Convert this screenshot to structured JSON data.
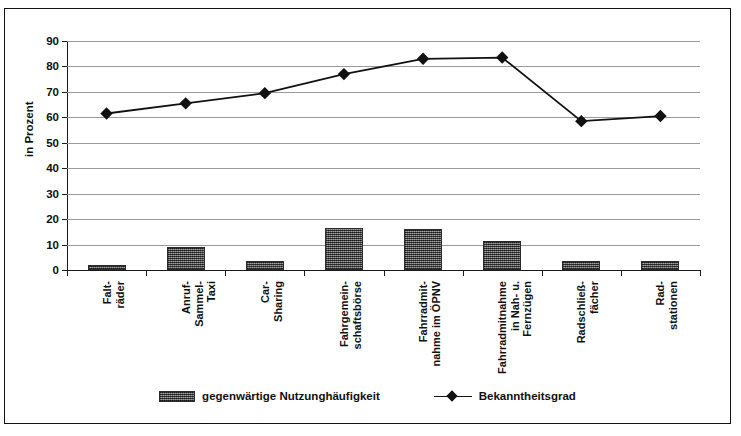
{
  "chart_data": {
    "type": "bar",
    "title": "",
    "xlabel": "",
    "ylabel": "in Prozent",
    "ylim": [
      0,
      90
    ],
    "yticks": [
      0,
      10,
      20,
      30,
      40,
      50,
      60,
      70,
      80,
      90
    ],
    "grid": true,
    "legend_position": "bottom",
    "categories": [
      "Falt-\nräder",
      "Anruf-\nSammel-\nTaxi",
      "Car-\nSharing",
      "Fahrgemein-\nschaftsbörse",
      "Fahrradmit-\nnahme im ÖPNV",
      "Fahrradmitnahme\nin Nah- u.\nFernzügen",
      "Radschließ-\nfächer",
      "Rad-\nstationen"
    ],
    "category_lines": [
      [
        "Falt-",
        "räder"
      ],
      [
        "Anruf-",
        "Sammel-",
        "Taxi"
      ],
      [
        "Car-",
        "Sharing"
      ],
      [
        "Fahrgemein-",
        "schaftsbörse"
      ],
      [
        "Fahrradmit-",
        "nahme im ÖPNV"
      ],
      [
        "Fahrradmitnahme",
        "in Nah- u.",
        "Fernzügen"
      ],
      [
        "Radschließ-",
        "fächer"
      ],
      [
        "Rad-",
        "stationen"
      ]
    ],
    "series": [
      {
        "name": "gegenwärtige Nutzunghäufigkeit",
        "type": "bar",
        "color": "#5d5d5d",
        "values": [
          2,
          9,
          3.5,
          16.5,
          16,
          11.5,
          3.5,
          3.5
        ]
      },
      {
        "name": "Bekanntheitsgrad",
        "type": "line",
        "color": "#111111",
        "marker": "diamond",
        "values": [
          61.5,
          65.5,
          69.5,
          77,
          83,
          83.5,
          58.5,
          60.5
        ]
      }
    ]
  },
  "legend": {
    "items": [
      {
        "label": "gegenwärtige Nutzunghäufigkeit",
        "swatch": "bar-hatched"
      },
      {
        "label": "Bekanntheitsgrad",
        "swatch": "line-diamond"
      }
    ]
  }
}
